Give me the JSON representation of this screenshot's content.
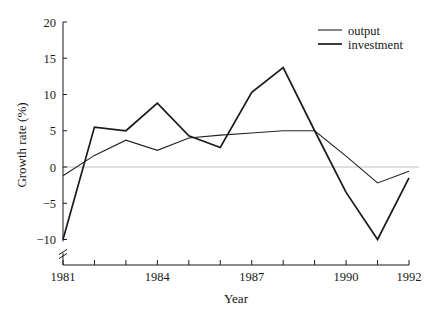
{
  "chart_data": {
    "type": "line",
    "title": "",
    "xlabel": "Year",
    "ylabel": "Growth rate (%)",
    "x": [
      1981,
      1982,
      1983,
      1984,
      1985,
      1986,
      1987,
      1988,
      1989,
      1990,
      1991,
      1992
    ],
    "xlim": [
      1981,
      1992
    ],
    "ylim": [
      -10,
      20
    ],
    "xticks": [
      1981,
      1982,
      1983,
      1984,
      1985,
      1986,
      1987,
      1988,
      1989,
      1990,
      1991,
      1992
    ],
    "xtick_labels": [
      "1981",
      "",
      "",
      "1984",
      "",
      "",
      "1987",
      "",
      "",
      "1990",
      "",
      "1992"
    ],
    "yticks": [
      -10,
      -5,
      0,
      5,
      10,
      15,
      20
    ],
    "ytick_labels": [
      "−10",
      "−5",
      "0",
      "5",
      "10",
      "15",
      "20"
    ],
    "grid": false,
    "zero_line": true,
    "zero_line_color": "#bfbfbf",
    "axis_break_y": true,
    "legend_position": "top-right",
    "series": [
      {
        "name": "output",
        "color": "#222222",
        "width": 1.1,
        "values": [
          -1.2,
          1.6,
          3.7,
          2.3,
          4.0,
          4.4,
          4.7,
          5.0,
          5.0,
          1.5,
          -2.2,
          -0.6
        ]
      },
      {
        "name": "investment",
        "color": "#1a1a1a",
        "width": 1.7,
        "values": [
          -10.0,
          5.5,
          5.0,
          8.8,
          4.3,
          2.7,
          10.3,
          13.7,
          5.0,
          -3.5,
          -10.0,
          -1.5
        ]
      }
    ]
  },
  "legend": {
    "entries": [
      {
        "label": "output"
      },
      {
        "label": "investment"
      }
    ]
  },
  "axes": {
    "x_title": "Year",
    "y_title": "Growth rate (%)"
  }
}
